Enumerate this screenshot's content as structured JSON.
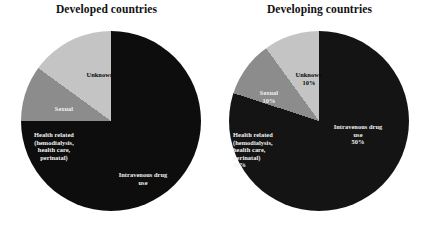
{
  "figure": {
    "panels": [
      {
        "id": "developed",
        "title": "Developed countries",
        "chart_data": {
          "type": "pie",
          "title": "Developed countries",
          "xlabel": "",
          "ylabel": "",
          "legend": "none",
          "grid": false,
          "show_percent_labels": false,
          "start_angle_deg": 0,
          "direction": "clockwise",
          "categories": [
            "Intravenous drug use",
            "Health related (hemodialysis, health care, perinatal)",
            "Sexual",
            "Unknown"
          ],
          "values": [
            60,
            15,
            10,
            15
          ],
          "colors": [
            "#0d0d0d",
            "#0d0d0d",
            "#8c8c8c",
            "#c4c4c4"
          ],
          "slices": [
            {
              "name": "intravenous-drug-use",
              "label": "Intravenous drug\nuse",
              "percent": null,
              "value": 60,
              "color": "#0d0d0d",
              "label_color": "#f2f2f2"
            },
            {
              "name": "health-related",
              "label": "Health related\n(hemodialysis,\nhealth care,\nperinatal)",
              "percent": null,
              "value": 15,
              "color": "#0d0d0d",
              "label_color": "#f2f2f2"
            },
            {
              "name": "sexual",
              "label": "Sexual",
              "percent": null,
              "value": 10,
              "color": "#8c8c8c",
              "label_color": "#f0f0f0"
            },
            {
              "name": "unknown",
              "label": "Unknown",
              "percent": null,
              "value": 15,
              "color": "#c4c4c4",
              "label_color": "#0a0a0a"
            }
          ]
        }
      },
      {
        "id": "developing",
        "title": "Developing countries",
        "chart_data": {
          "type": "pie",
          "title": "Developing countries",
          "xlabel": "",
          "ylabel": "",
          "legend": "none",
          "grid": false,
          "show_percent_labels": true,
          "start_angle_deg": 0,
          "direction": "clockwise",
          "categories": [
            "Intravenous drug use",
            "Health related (hemodialysis, health care, perinatal)",
            "Sexual",
            "Unknown"
          ],
          "values": [
            50,
            30,
            10,
            10
          ],
          "colors": [
            "#141414",
            "#141414",
            "#8c8c8c",
            "#c4c4c4"
          ],
          "slices": [
            {
              "name": "intravenous-drug-use",
              "label": "Intravenous drug\nuse\n50%",
              "percent": "50%",
              "value": 50,
              "color": "#141414",
              "label_color": "#f2f2f2"
            },
            {
              "name": "health-related",
              "label": "Health related\n(hemodialysis,\nhealth care,\nperinatal)\n30%",
              "percent": "30%",
              "value": 30,
              "color": "#141414",
              "label_color": "#f2f2f2"
            },
            {
              "name": "sexual",
              "label": "Sexual\n10%",
              "percent": "10%",
              "value": 10,
              "color": "#8c8c8c",
              "label_color": "#f0f0f0"
            },
            {
              "name": "unknown",
              "label": "Unknown\n10%",
              "percent": "10%",
              "value": 10,
              "color": "#c4c4c4",
              "label_color": "#0a0a0a"
            }
          ]
        }
      }
    ]
  }
}
